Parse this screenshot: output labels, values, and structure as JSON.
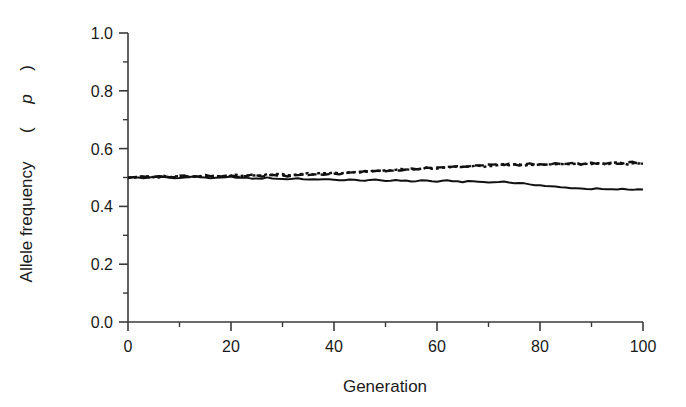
{
  "chart_data": {
    "type": "line",
    "title": "",
    "subtitle": "",
    "xlabel": "Generation",
    "ylabel": "Allele frequency (p)",
    "ylabel_plain": "Allele frequency",
    "ylabel_symbol": "p",
    "xlim": [
      0,
      100
    ],
    "ylim": [
      0.0,
      1.0
    ],
    "xticks": [
      0,
      20,
      40,
      60,
      80,
      100
    ],
    "xtick_labels": [
      "0",
      "20",
      "40",
      "60",
      "80",
      "100"
    ],
    "xminor_ticks": [
      10,
      30,
      50,
      70,
      90
    ],
    "yticks": [
      0.0,
      0.2,
      0.4,
      0.6,
      0.8,
      1.0
    ],
    "ytick_labels": [
      "0.0",
      "0.2",
      "0.4",
      "0.6",
      "0.8",
      "1.0"
    ],
    "yminor_ticks": [
      0.1,
      0.3,
      0.5,
      0.7,
      0.9
    ],
    "grid": false,
    "legend": "none",
    "line_color": "#111111",
    "axis_color": "#3a3a3a",
    "background": "#ffffff",
    "x": [
      0,
      1,
      2,
      3,
      4,
      5,
      6,
      7,
      8,
      9,
      10,
      11,
      12,
      13,
      14,
      15,
      16,
      17,
      18,
      19,
      20,
      21,
      22,
      23,
      24,
      25,
      26,
      27,
      28,
      29,
      30,
      31,
      32,
      33,
      34,
      35,
      36,
      37,
      38,
      39,
      40,
      41,
      42,
      43,
      44,
      45,
      46,
      47,
      48,
      49,
      50,
      51,
      52,
      53,
      54,
      55,
      56,
      57,
      58,
      59,
      60,
      61,
      62,
      63,
      64,
      65,
      66,
      67,
      68,
      69,
      70,
      71,
      72,
      73,
      74,
      75,
      76,
      77,
      78,
      79,
      80,
      81,
      82,
      83,
      84,
      85,
      86,
      87,
      88,
      89,
      90,
      91,
      92,
      93,
      94,
      95,
      96,
      97,
      98,
      99,
      100
    ],
    "series": [
      {
        "name": "replicate-1",
        "style": "solid",
        "values": [
          0.5,
          0.501,
          0.5,
          0.498,
          0.499,
          0.501,
          0.503,
          0.502,
          0.5,
          0.499,
          0.498,
          0.5,
          0.502,
          0.503,
          0.501,
          0.5,
          0.498,
          0.497,
          0.499,
          0.5,
          0.502,
          0.501,
          0.499,
          0.498,
          0.497,
          0.496,
          0.497,
          0.499,
          0.498,
          0.496,
          0.495,
          0.494,
          0.496,
          0.497,
          0.495,
          0.493,
          0.492,
          0.494,
          0.495,
          0.493,
          0.491,
          0.49,
          0.492,
          0.493,
          0.491,
          0.489,
          0.49,
          0.492,
          0.491,
          0.489,
          0.488,
          0.489,
          0.491,
          0.49,
          0.488,
          0.487,
          0.488,
          0.49,
          0.489,
          0.487,
          0.486,
          0.487,
          0.489,
          0.488,
          0.486,
          0.485,
          0.486,
          0.487,
          0.486,
          0.484,
          0.483,
          0.484,
          0.486,
          0.485,
          0.483,
          0.481,
          0.48,
          0.478,
          0.477,
          0.475,
          0.473,
          0.471,
          0.469,
          0.468,
          0.466,
          0.465,
          0.464,
          0.463,
          0.462,
          0.461,
          0.46,
          0.461,
          0.46,
          0.459,
          0.458,
          0.459,
          0.46,
          0.459,
          0.458,
          0.459,
          0.46
        ]
      },
      {
        "name": "replicate-2",
        "style": "dashed",
        "values": [
          0.5,
          0.502,
          0.503,
          0.501,
          0.5,
          0.502,
          0.504,
          0.503,
          0.501,
          0.502,
          0.504,
          0.505,
          0.503,
          0.502,
          0.504,
          0.506,
          0.505,
          0.503,
          0.504,
          0.506,
          0.507,
          0.505,
          0.504,
          0.506,
          0.508,
          0.507,
          0.505,
          0.506,
          0.508,
          0.509,
          0.507,
          0.506,
          0.508,
          0.51,
          0.509,
          0.507,
          0.509,
          0.511,
          0.51,
          0.512,
          0.514,
          0.513,
          0.515,
          0.517,
          0.516,
          0.518,
          0.52,
          0.519,
          0.521,
          0.523,
          0.522,
          0.524,
          0.526,
          0.525,
          0.527,
          0.529,
          0.528,
          0.53,
          0.532,
          0.531,
          0.533,
          0.535,
          0.534,
          0.536,
          0.538,
          0.537,
          0.539,
          0.541,
          0.54,
          0.542,
          0.544,
          0.543,
          0.545,
          0.544,
          0.546,
          0.545,
          0.543,
          0.545,
          0.547,
          0.546,
          0.544,
          0.546,
          0.548,
          0.547,
          0.545,
          0.547,
          0.549,
          0.548,
          0.546,
          0.548,
          0.55,
          0.549,
          0.547,
          0.549,
          0.551,
          0.55,
          0.548,
          0.55,
          0.552,
          0.551,
          0.549
        ]
      },
      {
        "name": "replicate-3",
        "style": "dotted",
        "values": [
          0.5,
          0.499,
          0.501,
          0.503,
          0.502,
          0.5,
          0.502,
          0.504,
          0.503,
          0.505,
          0.504,
          0.502,
          0.504,
          0.506,
          0.505,
          0.503,
          0.505,
          0.507,
          0.506,
          0.504,
          0.506,
          0.508,
          0.507,
          0.509,
          0.508,
          0.506,
          0.508,
          0.51,
          0.509,
          0.511,
          0.51,
          0.508,
          0.51,
          0.512,
          0.511,
          0.513,
          0.512,
          0.514,
          0.516,
          0.515,
          0.517,
          0.516,
          0.518,
          0.52,
          0.519,
          0.521,
          0.52,
          0.522,
          0.524,
          0.523,
          0.525,
          0.524,
          0.526,
          0.528,
          0.527,
          0.529,
          0.528,
          0.53,
          0.532,
          0.531,
          0.533,
          0.532,
          0.534,
          0.536,
          0.535,
          0.537,
          0.536,
          0.538,
          0.54,
          0.539,
          0.541,
          0.54,
          0.542,
          0.544,
          0.543,
          0.545,
          0.544,
          0.542,
          0.544,
          0.546,
          0.545,
          0.543,
          0.545,
          0.547,
          0.546,
          0.544,
          0.546,
          0.548,
          0.547,
          0.545,
          0.547,
          0.549,
          0.548,
          0.546,
          0.548,
          0.55,
          0.549,
          0.547,
          0.549,
          0.551,
          0.55
        ]
      }
    ]
  }
}
